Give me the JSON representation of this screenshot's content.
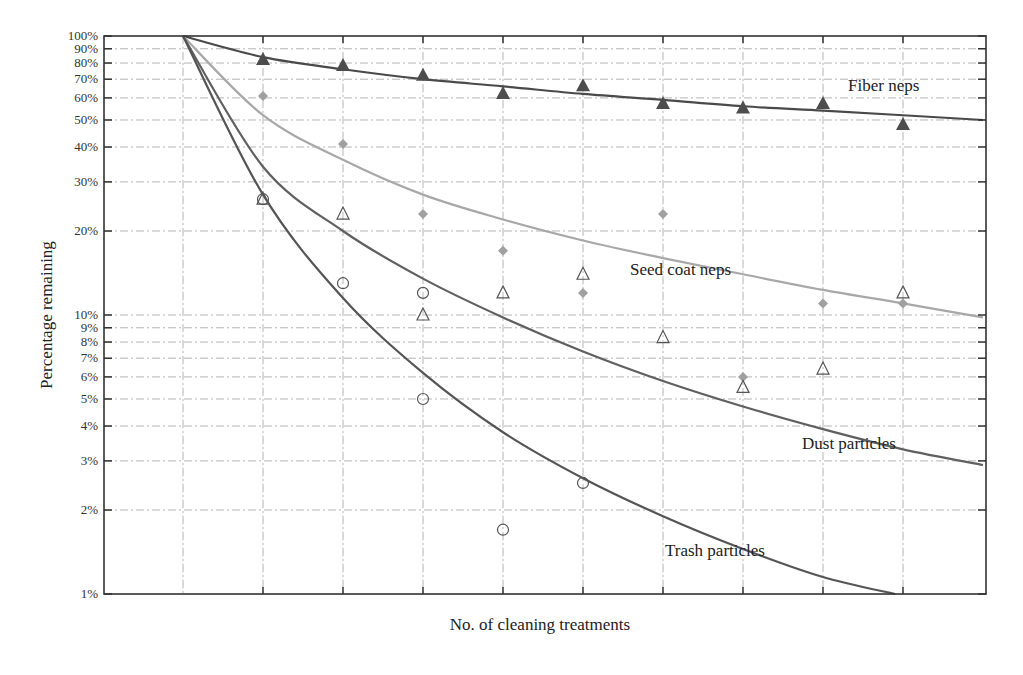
{
  "chart_data": {
    "type": "scatter",
    "title": "",
    "xlabel": "No. of cleaning treatments",
    "ylabel": "Percentage remaining",
    "yscale": "log",
    "ylim": [
      1,
      100
    ],
    "xlim": [
      -1,
      10
    ],
    "grid": true,
    "x_tick_labels_shown": false,
    "y_ticks": [
      "100%",
      "90%",
      "80%",
      "70%",
      "60%",
      "50%",
      "40%",
      "30%",
      "20%",
      "10%",
      "9%",
      "8%",
      "7%",
      "6%",
      "5%",
      "4%",
      "3%",
      "2%",
      "1%"
    ],
    "x": [
      1,
      2,
      3,
      4,
      5,
      6,
      7,
      8,
      9
    ],
    "series": [
      {
        "name": "Fiber neps",
        "marker": "filled-triangle",
        "color": "#555555",
        "points": [
          [
            1,
            82
          ],
          [
            2,
            78
          ],
          [
            3,
            72
          ],
          [
            4,
            62
          ],
          [
            5,
            66
          ],
          [
            6,
            57
          ],
          [
            7,
            55
          ],
          [
            8,
            57
          ],
          [
            9,
            48
          ]
        ],
        "fit_curve": [
          [
            0,
            100
          ],
          [
            1,
            84
          ],
          [
            2,
            76
          ],
          [
            3,
            70
          ],
          [
            4,
            66
          ],
          [
            5,
            62
          ],
          [
            6,
            59
          ],
          [
            7,
            56
          ],
          [
            8,
            54
          ],
          [
            9,
            52
          ],
          [
            10,
            50
          ]
        ]
      },
      {
        "name": "Seed coat neps",
        "marker": "filled-diamond",
        "color": "#999999",
        "points": [
          [
            1,
            61
          ],
          [
            2,
            41
          ],
          [
            3,
            23
          ],
          [
            4,
            17
          ],
          [
            5,
            12
          ],
          [
            6,
            23
          ],
          [
            7,
            6
          ],
          [
            8,
            11
          ],
          [
            9,
            11
          ]
        ],
        "fit_curve": [
          [
            0,
            100
          ],
          [
            1,
            52
          ],
          [
            2,
            36
          ],
          [
            3,
            27
          ],
          [
            4,
            22
          ],
          [
            5,
            18.5
          ],
          [
            6,
            16
          ],
          [
            7,
            14
          ],
          [
            8,
            12.3
          ],
          [
            9,
            11
          ],
          [
            10,
            9.8
          ]
        ]
      },
      {
        "name": "Dust particles",
        "marker": "open-triangle",
        "color": "#555555",
        "points": [
          [
            1,
            26
          ],
          [
            2,
            23
          ],
          [
            3,
            10
          ],
          [
            4,
            12
          ],
          [
            5,
            14
          ],
          [
            6,
            8.3
          ],
          [
            7,
            5.5
          ],
          [
            8,
            6.4
          ],
          [
            9,
            12
          ]
        ],
        "fit_curve": [
          [
            0,
            100
          ],
          [
            1,
            34
          ],
          [
            2,
            20
          ],
          [
            3,
            13.5
          ],
          [
            4,
            9.8
          ],
          [
            5,
            7.4
          ],
          [
            6,
            5.8
          ],
          [
            7,
            4.7
          ],
          [
            8,
            3.9
          ],
          [
            9,
            3.3
          ],
          [
            10,
            2.9
          ]
        ]
      },
      {
        "name": "Trash particles",
        "marker": "open-circle",
        "color": "#555555",
        "points": [
          [
            1,
            26
          ],
          [
            2,
            13
          ],
          [
            3,
            12
          ],
          [
            3,
            5
          ],
          [
            4,
            1.7
          ],
          [
            5,
            2.5
          ]
        ],
        "fit_curve": [
          [
            0,
            100
          ],
          [
            1,
            27
          ],
          [
            2,
            11.5
          ],
          [
            3,
            6.2
          ],
          [
            4,
            3.8
          ],
          [
            5,
            2.6
          ],
          [
            6,
            1.9
          ],
          [
            7,
            1.45
          ],
          [
            8,
            1.15
          ],
          [
            8.9,
            1.0
          ]
        ]
      }
    ],
    "annotations": [
      {
        "text": "Fiber neps",
        "x": 8.3,
        "y": 63
      },
      {
        "text": "Seed coat neps",
        "x": 5.6,
        "y": 15
      },
      {
        "text": "Dust particles",
        "x": 7.8,
        "y": 3.6
      },
      {
        "text": "Trash particles",
        "x": 6.0,
        "y": 1.5
      }
    ]
  },
  "labels": {
    "xlabel": "No. of cleaning treatments",
    "ylabel": "Percentage remaining",
    "fiber": "Fiber neps",
    "seed": "Seed coat neps",
    "dust": "Dust particles",
    "trash": "Trash particles"
  }
}
